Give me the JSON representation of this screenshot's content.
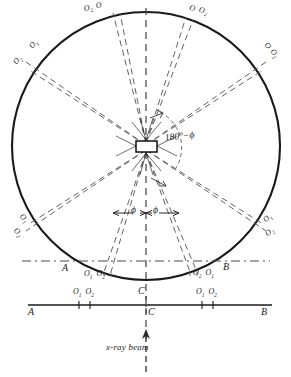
{
  "figure": {
    "type": "x-ray-diffraction-camera-geometry",
    "beam_label": "x-ray beam",
    "center_angle_label": "180°−ϕ",
    "phi_left_label": "ϕ",
    "phi_right_label": "ϕ",
    "line_color": "#1a1a1a",
    "dash_color": "#555555",
    "background": "#ffffff"
  },
  "points": {
    "A_arc": "A",
    "B_arc": "B",
    "C_arc": "C",
    "A_line": "A",
    "B_line": "B",
    "C_line": "C"
  },
  "ring_labels": [
    {
      "id": "top-left",
      "text_a": "O",
      "sub_a": "2",
      "text_b": "O",
      "sub_b": ""
    },
    {
      "id": "top-right",
      "text_a": "O",
      "sub_a": "",
      "text_b": "O",
      "sub_b": "2"
    },
    {
      "id": "upper-left",
      "text_a": "O",
      "sub_a": "1",
      "text_b": "O",
      "sub_b": "2"
    },
    {
      "id": "upper-right",
      "text_a": "O",
      "sub_a": "",
      "text_b": "O",
      "sub_b": "2"
    },
    {
      "id": "lower-left",
      "text_a": "O",
      "sub_a": "1",
      "text_b": "O",
      "sub_b": "2"
    },
    {
      "id": "lower-right",
      "text_a": "O",
      "sub_a": "1",
      "text_b": "O",
      "sub_b": "2"
    },
    {
      "id": "bottom-left",
      "text_a": "O",
      "sub_a": "1",
      "text_b": "O",
      "sub_b": "2"
    },
    {
      "id": "bottom-right",
      "text_a": "O",
      "sub_a": "2",
      "text_b": "O",
      "sub_b": "1"
    }
  ],
  "labels": {
    "tl_o2": "O",
    "tl_o2_sub": "2",
    "tl_o": "O",
    "tr_o": "O",
    "tr_o2": "O",
    "tr_o2_sub": "2",
    "ul_o1": "O",
    "ul_o1_sub": "1",
    "ul_o2": "O",
    "ul_o2_sub": "2",
    "ur_o": "O",
    "ur_o_sub": "",
    "ur_o2": "O",
    "ur_o2_sub": "2",
    "ll_o1": "O",
    "ll_o1_sub": "1",
    "ll_o2": "O",
    "ll_o2_sub": "2",
    "lr_o1": "O",
    "lr_o1_sub": "1",
    "lr_o2": "O",
    "lr_o2_sub": "2",
    "bl_arc_o1": "O",
    "bl_arc_o1_sub": "1",
    "bl_arc_o2": "O",
    "bl_arc_o2_sub": "2",
    "br_arc_o2": "O",
    "br_arc_o2_sub": "2",
    "br_arc_o1": "O",
    "br_arc_o1_sub": "1",
    "bl_line_o1": "O",
    "bl_line_o1_sub": "1",
    "bl_line_o2": "O",
    "bl_line_o2_sub": "2",
    "br_line_o1": "O",
    "br_line_o1_sub": "1",
    "br_line_o2": "O",
    "br_line_o2_sub": "2"
  },
  "geometry": {
    "circle_cx": 146,
    "circle_cy": 146,
    "circle_r": 134,
    "specimen_w": 20,
    "specimen_h": 10,
    "baseline_y": 305,
    "baseline_x1": 28,
    "baseline_x2": 272,
    "chord_y": 261
  }
}
